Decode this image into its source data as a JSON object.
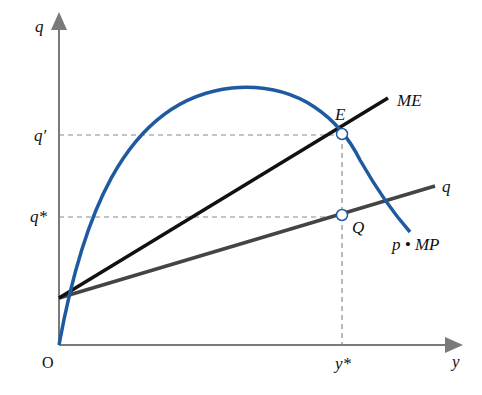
{
  "diagram": {
    "title": "",
    "axes": {
      "y_axis_label": "q",
      "x_axis_label": "y",
      "origin_label": "O"
    },
    "ticks": {
      "q_prime": "q′",
      "q_star": "q*",
      "y_star": "y*"
    },
    "curves": [
      {
        "id": "ME",
        "label": "ME",
        "color": "#111111",
        "type": "line"
      },
      {
        "id": "q",
        "label": "q",
        "color": "#444444",
        "type": "line"
      },
      {
        "id": "pMP",
        "label": "p • MP",
        "color": "#1f5aa0",
        "type": "curve"
      }
    ],
    "points": [
      {
        "id": "E",
        "label": "E",
        "desc": "intersection of ME and p·MP at (y*, q′)"
      },
      {
        "id": "Q",
        "label": "Q",
        "desc": "point on q line at (y*, q*)"
      }
    ],
    "colors": {
      "axis": "#7a7a7a",
      "guide": "#8a8a8a",
      "blue_curve": "#1f5aa0",
      "me_line": "#111111",
      "q_line": "#444444"
    }
  }
}
